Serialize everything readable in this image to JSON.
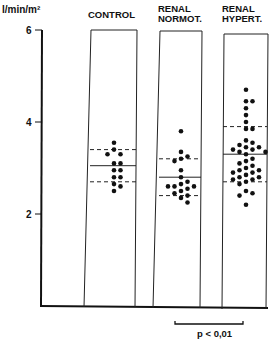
{
  "chart_data": {
    "type": "scatter",
    "title": "",
    "ylabel": "l/min/m²",
    "xlabel": "",
    "ylim": [
      0,
      6
    ],
    "yticks": [
      2,
      4,
      6
    ],
    "grid": false,
    "categories": [
      "CONTROL",
      "RENAL NORMOT.",
      "RENAL HYPERT."
    ],
    "category_lines": [
      [
        "CONTROL"
      ],
      [
        "RENAL",
        "NORMOT."
      ],
      [
        "RENAL",
        "HYPERT."
      ]
    ],
    "series": [
      {
        "name": "CONTROL",
        "mean": 3.05,
        "sd_upper": 3.4,
        "sd_lower": 2.7,
        "points": [
          3.55,
          3.4,
          3.3,
          3.3,
          3.1,
          3.1,
          2.95,
          2.95,
          2.8,
          2.8,
          2.65,
          2.6,
          2.5
        ]
      },
      {
        "name": "RENAL NORMOT.",
        "mean": 2.8,
        "sd_upper": 3.2,
        "sd_lower": 2.4,
        "points": [
          3.8,
          3.35,
          3.25,
          3.2,
          3.15,
          2.95,
          2.8,
          2.7,
          2.65,
          2.6,
          2.6,
          2.6,
          2.55,
          2.5,
          2.45,
          2.4,
          2.35,
          2.25
        ]
      },
      {
        "name": "RENAL HYPERT.",
        "mean": 3.3,
        "sd_upper": 3.9,
        "sd_lower": 2.7,
        "points": [
          4.7,
          4.45,
          4.45,
          4.3,
          4.15,
          4.0,
          3.85,
          3.85,
          3.6,
          3.55,
          3.5,
          3.45,
          3.45,
          3.4,
          3.4,
          3.35,
          3.35,
          3.3,
          3.2,
          3.15,
          3.1,
          3.05,
          3.0,
          2.95,
          2.95,
          2.9,
          2.9,
          2.85,
          2.8,
          2.8,
          2.75,
          2.75,
          2.7,
          2.65,
          2.5,
          2.45,
          2.4,
          2.2
        ]
      }
    ],
    "annotations": [
      {
        "text": "p < 0,01",
        "between": [
          "RENAL NORMOT.",
          "RENAL HYPERT."
        ]
      }
    ]
  },
  "labels": {
    "ylabel": "l/min/m²",
    "pvalue": "p < 0,01"
  }
}
